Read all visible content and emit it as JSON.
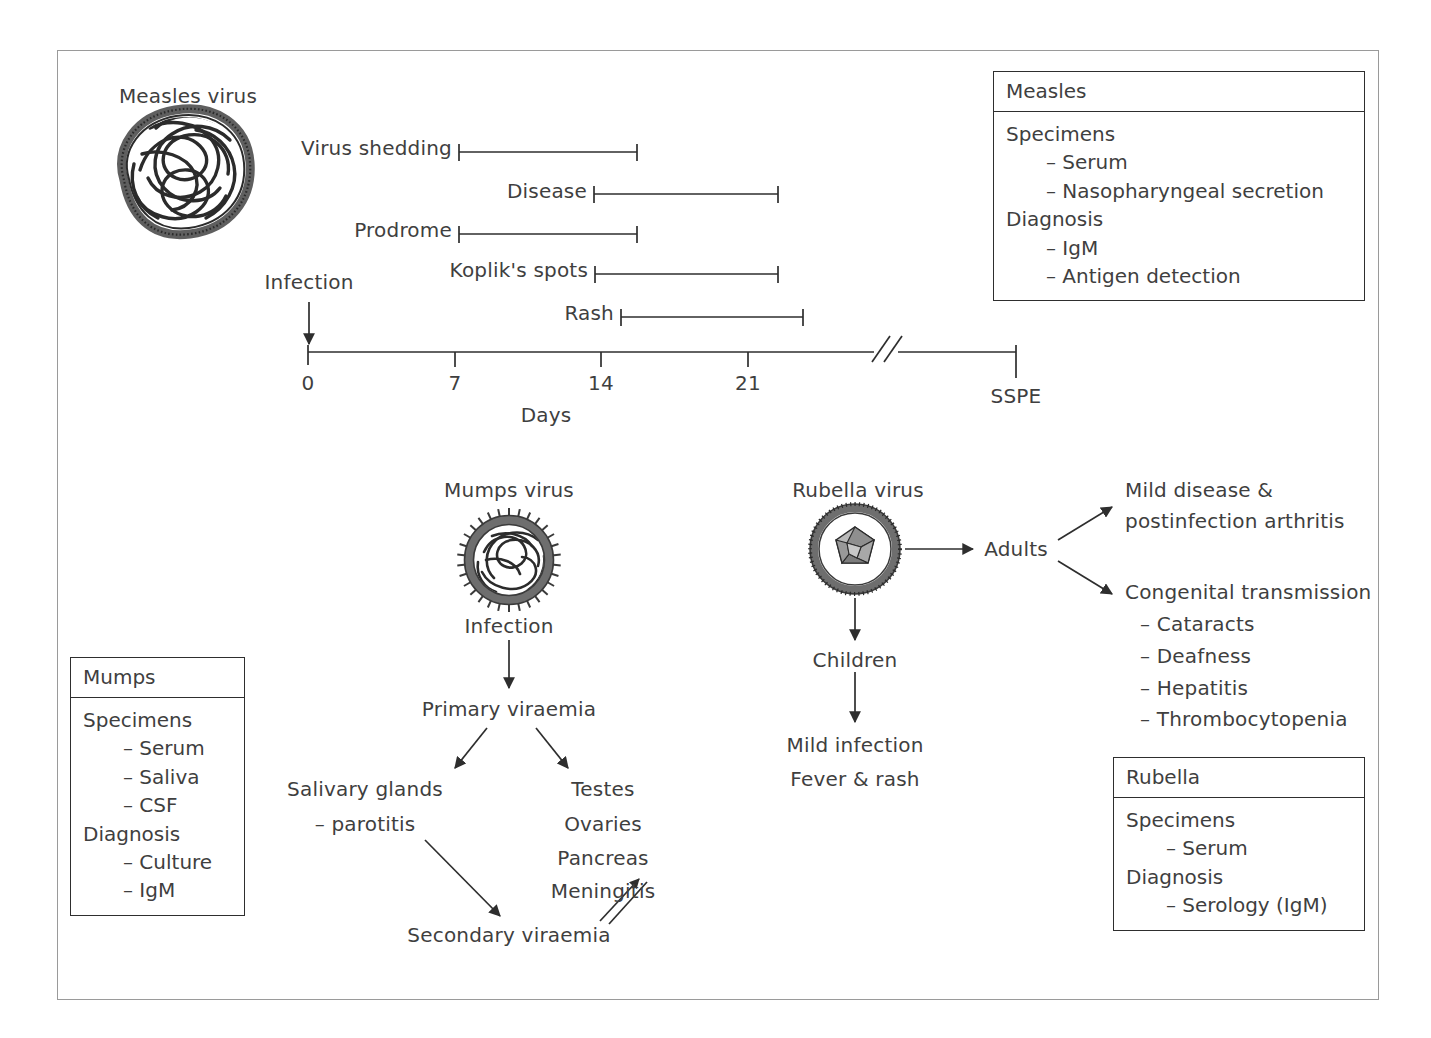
{
  "measles": {
    "virus_label": "Measles virus",
    "infection_label": "Infection",
    "axis_label": "Days",
    "sspe_label": "SSPE",
    "tick_labels": [
      "0",
      "7",
      "14",
      "21"
    ],
    "bars": [
      {
        "name": "Virus shedding",
        "start_day": 7,
        "end_day": 15.5
      },
      {
        "name": "Disease",
        "start_day": 13.5,
        "end_day": 22.5
      },
      {
        "name": "Prodrome",
        "start_day": 7,
        "end_day": 14
      },
      {
        "name": "Koplik's spots",
        "start_day": 13.5,
        "end_day": 22.5
      },
      {
        "name": "Rash",
        "start_day": 14.5,
        "end_day": 23.5
      }
    ],
    "box": {
      "title": "Measles",
      "lines": [
        {
          "text": "Specimens",
          "indent": 0
        },
        {
          "text": "– Serum",
          "indent": 1
        },
        {
          "text": "– Nasopharyngeal secretion",
          "indent": 1
        },
        {
          "text": "Diagnosis",
          "indent": 0
        },
        {
          "text": "– IgM",
          "indent": 1
        },
        {
          "text": "– Antigen detection",
          "indent": 1
        }
      ]
    }
  },
  "mumps": {
    "virus_label": "Mumps virus",
    "flow": {
      "infection": "Infection",
      "primary_viraemia": "Primary viraemia",
      "salivary_glands": "Salivary glands",
      "parotitis": "– parotitis",
      "organs": [
        "Testes",
        "Ovaries",
        "Pancreas",
        "Meningitis"
      ],
      "secondary_viraemia": "Secondary viraemia"
    },
    "box": {
      "title": "Mumps",
      "lines": [
        {
          "text": "Specimens",
          "indent": 0
        },
        {
          "text": "– Serum",
          "indent": 1
        },
        {
          "text": "– Saliva",
          "indent": 1
        },
        {
          "text": "– CSF",
          "indent": 1
        },
        {
          "text": "Diagnosis",
          "indent": 0
        },
        {
          "text": "– Culture",
          "indent": 1
        },
        {
          "text": "– IgM",
          "indent": 1
        }
      ]
    }
  },
  "rubella": {
    "virus_label": "Rubella virus",
    "flow": {
      "adults": "Adults",
      "children": "Children",
      "mild_infection": "Mild infection",
      "fever_rash": "Fever & rash",
      "adult_outcome_line1": "Mild disease &",
      "adult_outcome_line2": "postinfection arthritis",
      "congenital_title": "Congenital transmission",
      "congenital_items": [
        "– Cataracts",
        "– Deafness",
        "– Hepatitis",
        "– Thrombocytopenia"
      ]
    },
    "box": {
      "title": "Rubella",
      "lines": [
        {
          "text": "Specimens",
          "indent": 0
        },
        {
          "text": "– Serum",
          "indent": 2
        },
        {
          "text": "Diagnosis",
          "indent": 0
        },
        {
          "text": "– Serology (IgM)",
          "indent": 2
        }
      ]
    }
  },
  "colors": {
    "ink": "#3f3f3f",
    "line": "#2e2e2e",
    "frame": "#9a9a9a",
    "envelope": "#6e6e6e",
    "capsid": "#8a8a8a"
  }
}
